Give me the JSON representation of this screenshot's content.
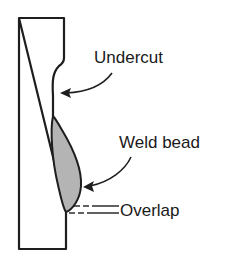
{
  "diagram": {
    "labels": {
      "undercut": "Undercut",
      "weld_bead": "Weld bead",
      "overlap": "Overlap"
    },
    "colors": {
      "outline": "#1e1e1e",
      "bead_fill": "#b4b4b4",
      "background": "#ffffff"
    }
  }
}
